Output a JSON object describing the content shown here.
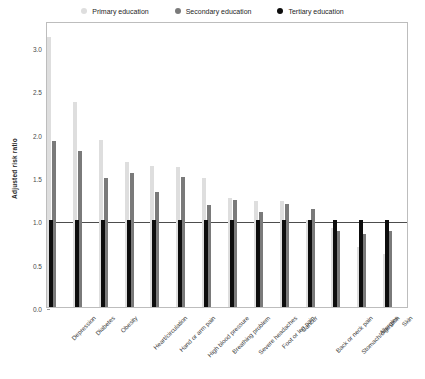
{
  "chart_data": {
    "type": "bar",
    "title": "",
    "xlabel": "",
    "ylabel": "Adjusted risk ratio",
    "ylim": [
      0.0,
      3.3
    ],
    "yticks": [
      "0.0",
      "0.5",
      "1.0",
      "1.5",
      "2.0",
      "2.5",
      "3.0"
    ],
    "ytick_values": [
      0.0,
      0.5,
      1.0,
      1.5,
      2.0,
      2.5,
      3.0
    ],
    "grid": false,
    "legend_position": "top-center",
    "reference_line": 1.0,
    "categories": [
      "Depression",
      "Diabetes",
      "Obesity",
      "Heart/circulation",
      "Hand or arm pain",
      "High blood pressure",
      "Breathing problem",
      "Severe headaches",
      "Foot or leg pain",
      "Cancer",
      "Back or neck pain",
      "Stomach/digestion",
      "Allergies",
      "Skin"
    ],
    "series": [
      {
        "name": "Primary education",
        "color": "#dedede",
        "values": [
          3.11,
          2.37,
          1.93,
          1.67,
          1.63,
          1.61,
          1.49,
          1.26,
          1.22,
          1.22,
          1.0,
          0.91,
          0.69,
          0.61
        ]
      },
      {
        "name": "Secondary education",
        "color": "#7a7a7a",
        "values": [
          1.91,
          1.8,
          1.49,
          1.55,
          1.33,
          1.5,
          1.18,
          1.23,
          1.1,
          1.19,
          1.13,
          0.88,
          0.84,
          0.88
        ]
      },
      {
        "name": "Tertiary education",
        "color": "#0d0d0d",
        "values": [
          1.0,
          1.0,
          1.0,
          1.0,
          1.0,
          1.0,
          1.0,
          1.0,
          1.0,
          1.0,
          1.0,
          1.0,
          1.0,
          1.0
        ]
      }
    ]
  },
  "legend": {
    "items": [
      {
        "label": "Primary education",
        "color": "#dedede"
      },
      {
        "label": "Secondary education",
        "color": "#7a7a7a"
      },
      {
        "label": "Tertiary education",
        "color": "#0d0d0d"
      }
    ]
  }
}
